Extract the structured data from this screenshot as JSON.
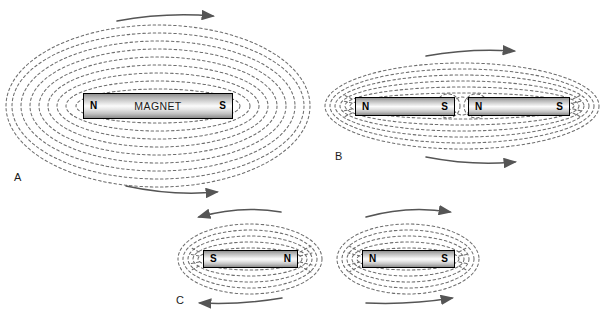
{
  "figure": {
    "background": "#ffffff",
    "field_line_color": "#6e6e6e",
    "arrow_color": "#555555",
    "magnet_border_color": "#000000"
  },
  "panels": [
    {
      "id": "A",
      "label": "A",
      "caption": "Single bar magnet field",
      "magnets": [
        {
          "name": "MAGNET",
          "left_pole": "N",
          "right_pole": "S",
          "x": 83,
          "y": 93,
          "w": 150,
          "h": 26
        }
      ],
      "arrows": [
        {
          "position": "top",
          "direction": "right",
          "x1": 117,
          "y1": 21,
          "x2": 213,
          "y2": 16
        },
        {
          "position": "bottom",
          "direction": "right",
          "x1": 126,
          "y1": 186,
          "x2": 217,
          "y2": 192
        }
      ]
    },
    {
      "id": "B",
      "label": "B",
      "caption": "Two magnets attracting, unlike poles facing",
      "magnets": [
        {
          "name": "",
          "left_pole": "N",
          "right_pole": "S",
          "x": 355,
          "y": 97,
          "w": 100,
          "h": 19
        },
        {
          "name": "",
          "left_pole": "N",
          "right_pole": "S",
          "x": 468,
          "y": 97,
          "w": 102,
          "h": 19
        }
      ],
      "arrows": [
        {
          "position": "top",
          "direction": "right",
          "x1": 426,
          "y1": 56,
          "x2": 514,
          "y2": 51
        },
        {
          "position": "bottom",
          "direction": "right",
          "x1": 426,
          "y1": 157,
          "x2": 515,
          "y2": 162
        }
      ]
    },
    {
      "id": "C",
      "label": "C",
      "caption": "Two magnets repelling, like poles facing",
      "magnets": [
        {
          "name": "",
          "left_pole": "S",
          "right_pole": "N",
          "x": 203,
          "y": 250,
          "w": 95,
          "h": 18
        },
        {
          "name": "",
          "left_pole": "N",
          "right_pole": "S",
          "x": 362,
          "y": 250,
          "w": 93,
          "h": 18
        }
      ],
      "arrows": [
        {
          "position": "top",
          "direction": "left",
          "x1": 281,
          "y1": 212,
          "x2": 199,
          "y2": 217
        },
        {
          "position": "top",
          "direction": "right",
          "x1": 366,
          "y1": 217,
          "x2": 450,
          "y2": 212
        },
        {
          "position": "bottom",
          "direction": "left",
          "x1": 282,
          "y1": 298,
          "x2": 200,
          "y2": 303
        },
        {
          "position": "bottom",
          "direction": "right",
          "x1": 366,
          "y1": 303,
          "x2": 452,
          "y2": 298
        }
      ]
    }
  ]
}
